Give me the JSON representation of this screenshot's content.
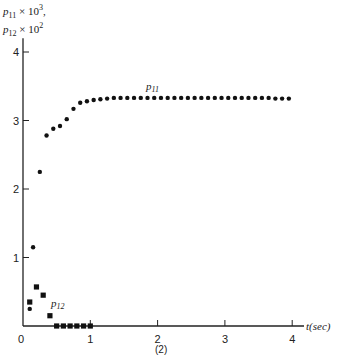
{
  "figure": {
    "caption": "(2)",
    "ylabel_line1": {
      "var": "p",
      "sub": "11",
      "times": " × 10",
      "exp": "3",
      "suffix": ","
    },
    "ylabel_line2": {
      "var": "p",
      "sub": "12",
      "times": " × 10",
      "exp": "2",
      "suffix": ""
    },
    "xlabel": "t(sec)"
  },
  "chart_data": {
    "type": "scatter",
    "title": "",
    "xlabel": "t(sec)",
    "ylabel": "p11 × 10^3, p12 × 10^2",
    "xlim": [
      0,
      4.2
    ],
    "ylim": [
      0,
      4.2
    ],
    "xticks": [
      0,
      1,
      2,
      3,
      4
    ],
    "yticks": [
      1,
      2,
      3,
      4
    ],
    "grid": false,
    "legend": "inline annotations",
    "series": [
      {
        "name": "p11",
        "marker": "circle",
        "annotation": "p11",
        "x": [
          0.1,
          0.15,
          0.25,
          0.35,
          0.45,
          0.55,
          0.65,
          0.75,
          0.85,
          0.95,
          1.05,
          1.15,
          1.25,
          1.35,
          1.45,
          1.55,
          1.65,
          1.75,
          1.85,
          1.95,
          2.05,
          2.15,
          2.25,
          2.35,
          2.45,
          2.55,
          2.65,
          2.75,
          2.85,
          2.95,
          3.05,
          3.15,
          3.25,
          3.35,
          3.45,
          3.55,
          3.65,
          3.75,
          3.85,
          3.95
        ],
        "values": [
          0.25,
          1.15,
          2.25,
          2.78,
          2.88,
          2.92,
          3.02,
          3.17,
          3.26,
          3.28,
          3.3,
          3.31,
          3.32,
          3.33,
          3.33,
          3.33,
          3.33,
          3.33,
          3.33,
          3.33,
          3.33,
          3.33,
          3.33,
          3.33,
          3.33,
          3.33,
          3.33,
          3.33,
          3.33,
          3.33,
          3.33,
          3.33,
          3.33,
          3.33,
          3.33,
          3.33,
          3.33,
          3.32,
          3.32,
          3.32
        ]
      },
      {
        "name": "p12",
        "marker": "square",
        "annotation": "p12",
        "x": [
          0.1,
          0.2,
          0.3,
          0.4,
          0.5,
          0.6,
          0.7,
          0.8,
          0.9,
          1.0
        ],
        "values": [
          0.35,
          0.57,
          0.45,
          0.15,
          0.0,
          0.0,
          0.0,
          0.0,
          0.0,
          0.0
        ]
      }
    ]
  }
}
